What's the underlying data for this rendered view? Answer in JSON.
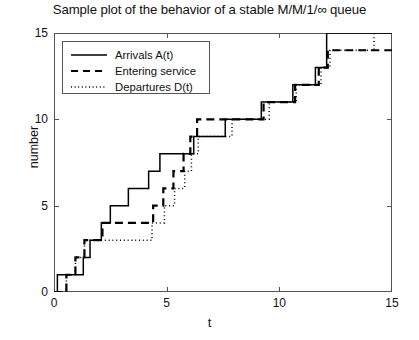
{
  "chart_data": {
    "type": "line",
    "title": "Sample plot of the behavior of a stable M/M/1/∞ queue",
    "xlabel": "t",
    "ylabel": "number",
    "xlim": [
      0,
      15
    ],
    "ylim": [
      0,
      15
    ],
    "xticks": [
      0,
      5,
      10,
      15
    ],
    "yticks": [
      0,
      5,
      10,
      15
    ],
    "xtick_labels": [
      "0",
      "5",
      "10",
      "15"
    ],
    "ytick_labels": [
      "0",
      "5",
      "10",
      "15"
    ],
    "grid": false,
    "legend_position": "upper left",
    "series": [
      {
        "name": "Arrivals A(t)",
        "style": "solid",
        "color": "#000000",
        "step": "post",
        "x": [
          0,
          0.15,
          0.7,
          1.3,
          1.6,
          2.1,
          2.5,
          3.3,
          4.2,
          4.7,
          6.2,
          7.6,
          9.2,
          10.6,
          11.6,
          12.1,
          15
        ],
        "y": [
          0,
          1,
          1,
          2,
          3,
          4,
          5,
          6,
          7,
          8,
          9,
          10,
          11,
          12,
          13,
          15,
          15
        ]
      },
      {
        "name": "Entering service",
        "style": "dashed",
        "color": "#000000",
        "step": "post",
        "x": [
          0,
          0.55,
          0.95,
          1.35,
          2.15,
          4.4,
          4.85,
          5.3,
          5.75,
          6.05,
          6.35,
          7.6,
          9.3,
          10.7,
          11.75,
          12.15,
          15
        ],
        "y": [
          0,
          1,
          2,
          3,
          4,
          5,
          6,
          7,
          8,
          9,
          10,
          10,
          11,
          12,
          13,
          14,
          14
        ]
      },
      {
        "name": "Departures D(t)",
        "style": "dotted",
        "color": "#000000",
        "step": "post",
        "x": [
          0,
          0.55,
          0.95,
          1.35,
          4.35,
          4.9,
          5.35,
          5.8,
          6.1,
          6.4,
          7.9,
          9.55,
          10.75,
          11.85,
          12.25,
          13.0,
          14.2,
          15
        ],
        "y": [
          0,
          1,
          2,
          3,
          4,
          5,
          6,
          7,
          8,
          9,
          10,
          11,
          12,
          13,
          14,
          14,
          15,
          15
        ]
      }
    ]
  }
}
